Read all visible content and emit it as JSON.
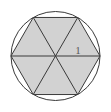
{
  "figure": {
    "background_color": "#ffffff",
    "circle": {
      "name": "circumscribed-circle",
      "center_x": 55.5,
      "center_y": 56,
      "radius": 44.5,
      "stroke_color": "#3a3a3a",
      "stroke_width": 1,
      "fill": "none"
    },
    "hexagon": {
      "name": "inscribed-regular-hexagon",
      "sides": 6,
      "fill_color": "#d2d2d2",
      "stroke_color": "#3a3a3a",
      "stroke_width": 1,
      "points": "100,56 77.75,94.54 33.25,94.54 11,56 33.25,17.46 77.75,17.46"
    },
    "diagonals": {
      "name": "hexagon-diagonals",
      "count": 3,
      "stroke_color": "#3a3a3a",
      "stroke_width": 1,
      "lines": [
        {
          "x1": 11,
          "y1": 56,
          "x2": 100,
          "y2": 56
        },
        {
          "x1": 33.25,
          "y1": 17.46,
          "x2": 77.75,
          "y2": 94.54
        },
        {
          "x1": 77.75,
          "y1": 17.46,
          "x2": 33.25,
          "y2": 94.54
        }
      ]
    },
    "labels": [
      {
        "name": "side-length-label",
        "text": "1",
        "x": 78,
        "y": 54,
        "color": "#5a5a5a"
      }
    ]
  }
}
